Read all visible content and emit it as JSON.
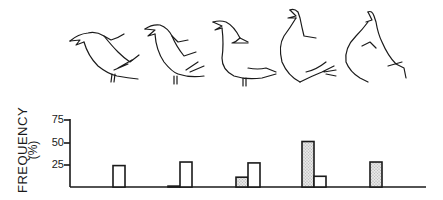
{
  "chart_data": {
    "type": "bar",
    "title": "",
    "xlabel": "",
    "ylabel": "FREQUENCY",
    "ylabel_unit": "(%)",
    "ylim": [
      0,
      75
    ],
    "yticks": [
      25,
      50,
      75
    ],
    "grid": false,
    "legend": null,
    "categories": [
      "Posture 1",
      "Posture 2",
      "Posture 3",
      "Posture 4",
      "Posture 5"
    ],
    "category_images": [
      "bird-posture-1",
      "bird-posture-2",
      "bird-posture-3",
      "bird-posture-4",
      "bird-posture-5"
    ],
    "series": [
      {
        "name": "stippled",
        "fill": "stippled",
        "values": [
          0,
          1,
          11,
          51,
          28
        ]
      },
      {
        "name": "open",
        "fill": "open",
        "values": [
          24,
          28,
          27,
          12,
          0
        ]
      }
    ]
  },
  "axis": {
    "ylabel": "FREQUENCY",
    "yunit": "(%)",
    "ticks": [
      {
        "value": "75",
        "y": 120
      },
      {
        "value": "50",
        "y": 143
      },
      {
        "value": "25",
        "y": 165
      }
    ]
  },
  "colors": {
    "ink": "#1a1a1a",
    "stipple": "#d4d4d4",
    "background": "#ffffff"
  }
}
